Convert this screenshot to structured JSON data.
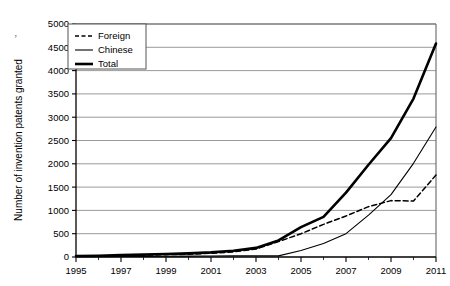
{
  "chart_data": {
    "type": "line",
    "title": "",
    "xlabel": "",
    "ylabel": "Number of invention patents granted",
    "x": [
      1995,
      1996,
      1997,
      1998,
      1999,
      2000,
      2001,
      2002,
      2003,
      2004,
      2005,
      2006,
      2007,
      2008,
      2009,
      2010,
      2011
    ],
    "xlim": [
      1995,
      2011
    ],
    "ylim": [
      0,
      5000
    ],
    "xtick_labels": [
      "1995",
      "1997",
      "1999",
      "2001",
      "2003",
      "2005",
      "2007",
      "2009",
      "2011"
    ],
    "xticks": [
      1995,
      1997,
      1999,
      2001,
      2003,
      2005,
      2007,
      2009,
      2011
    ],
    "yticks": [
      0,
      500,
      1000,
      1500,
      2000,
      2500,
      3000,
      3500,
      4000,
      4500,
      5000
    ],
    "ytick_labels": [
      "0",
      "500",
      "1000",
      "1500",
      "2000",
      "2500",
      "3000",
      "3500",
      "4000",
      "4500",
      "5000"
    ],
    "grid": "horizontal",
    "legend_position": "top-left",
    "series": [
      {
        "name": "Foreign",
        "style": "dashed",
        "values": [
          15,
          20,
          30,
          40,
          50,
          60,
          80,
          110,
          170,
          330,
          500,
          700,
          880,
          1080,
          1210,
          1200,
          1760
        ]
      },
      {
        "name": "Chinese",
        "style": "thin-solid",
        "values": [
          5,
          8,
          10,
          12,
          15,
          18,
          20,
          25,
          25,
          25,
          140,
          290,
          500,
          900,
          1340,
          2010,
          2790
        ]
      },
      {
        "name": "Total",
        "style": "thick-solid",
        "values": [
          20,
          28,
          40,
          52,
          65,
          78,
          100,
          135,
          195,
          355,
          640,
          860,
          1380,
          1980,
          2550,
          3400,
          4580
        ]
      }
    ]
  },
  "legend": {
    "items": [
      {
        "label": "Foreign"
      },
      {
        "label": "Chinese"
      },
      {
        "label": "Total"
      }
    ]
  },
  "artifact": {
    "mark": "’"
  },
  "colors": {
    "line": "#000000",
    "grid": "#808080",
    "frame": "#666666",
    "background": "#ffffff"
  }
}
